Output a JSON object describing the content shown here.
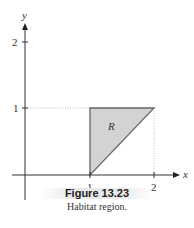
{
  "figure": {
    "title": "Figure 13.23",
    "caption": "Habitat region."
  },
  "axes": {
    "x_label": "x",
    "y_label": "y",
    "x_ticks": [
      "1",
      "2"
    ],
    "y_ticks": [
      "1",
      "2"
    ]
  },
  "region": {
    "label": "R",
    "vertices": [
      [
        1,
        1
      ],
      [
        2,
        1
      ],
      [
        1,
        0
      ]
    ],
    "fill": "#d3d3d3",
    "stroke": "#666666"
  },
  "colors": {
    "axis": "#333333",
    "guide": "#aaaaaa"
  }
}
